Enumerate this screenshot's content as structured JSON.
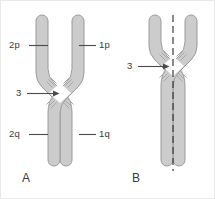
{
  "figure": {
    "background_color": "#ffffff",
    "chromatid_fill": "#cccccc",
    "chromatid_stroke": "#9a9a9a",
    "centromere_fill": "#ffffff",
    "label_color": "#3a3a3a",
    "leader_line_color": "#4a4a4a"
  },
  "panels": [
    {
      "id": "A",
      "label": "A",
      "label_x": 21,
      "label_y": 171,
      "callouts": [
        {
          "name": "2p",
          "text": "2p",
          "label_x": 10,
          "label_y": 39,
          "leader_x1": 28,
          "leader_x2": 47,
          "leader_y": 44,
          "side": "left"
        },
        {
          "name": "1p",
          "text": "1p",
          "label_x": 99,
          "label_y": 39,
          "leader_x1": 78,
          "leader_x2": 95,
          "leader_y": 44,
          "side": "right"
        },
        {
          "name": "3",
          "text": "3",
          "label_x": 16,
          "label_y": 87,
          "leader_x1": 26,
          "leader_x2": 57,
          "leader_y": 92,
          "side": "left",
          "arrow": true
        },
        {
          "name": "2q",
          "text": "2q",
          "label_x": 10,
          "label_y": 128,
          "leader_x1": 28,
          "leader_x2": 47,
          "leader_y": 133,
          "side": "left"
        },
        {
          "name": "1q",
          "text": "1q",
          "label_x": 99,
          "label_y": 128,
          "leader_x1": 78,
          "leader_x2": 95,
          "leader_y": 133,
          "side": "right"
        }
      ]
    },
    {
      "id": "B",
      "label": "B",
      "label_x": 131,
      "label_y": 171,
      "axis_line": {
        "name": "symmetry-axis",
        "x": 172,
        "y1": 14,
        "y2": 170,
        "dash": "7,4"
      },
      "callouts": [
        {
          "name": "3",
          "text": "3",
          "label_x": 127,
          "label_y": 60,
          "leader_x1": 137,
          "leader_x2": 167,
          "leader_y": 65,
          "side": "left",
          "arrow": true
        }
      ]
    }
  ]
}
